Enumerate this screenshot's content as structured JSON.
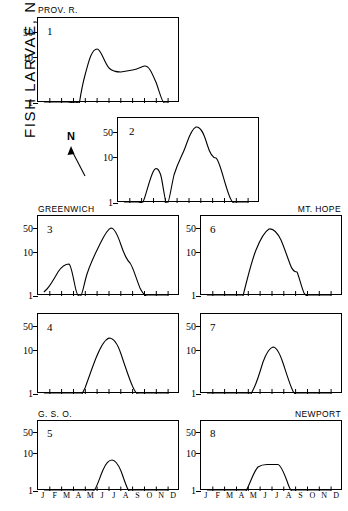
{
  "figure": {
    "y_axis_title_main": "FISH  LARVAE,  No. / m",
    "y_axis_title_exponent": "3",
    "compass_label": "N",
    "station_captions": {
      "prov_r": "PROV.  R.",
      "greenwich": "GREENWICH",
      "mt_hope": "MT.  HOPE",
      "gso": "G.  S.  O.",
      "newport": "NEWPORT"
    },
    "y_tick_labels": [
      "50",
      "10",
      "1"
    ],
    "month_labels": [
      "J",
      "F",
      "M",
      "A",
      "M",
      "J",
      "J",
      "A",
      "S",
      "O",
      "N",
      "D"
    ],
    "panel_numbers": [
      "1",
      "2",
      "3",
      "4",
      "5",
      "6",
      "7",
      "8"
    ]
  },
  "chart_data": [
    {
      "type": "line",
      "title": "PROV.  R.",
      "panel": "1",
      "xlabel": "",
      "ylabel": "FISH LARVAE, No./m3",
      "yscale": "log",
      "ylim": [
        1,
        70
      ],
      "yticks": [
        1,
        10,
        50
      ],
      "grid": false,
      "legend": "none",
      "x": [
        "J",
        "F",
        "M",
        "A",
        "M",
        "J",
        "J",
        "A",
        "S",
        "O",
        "N",
        "D"
      ],
      "values": [
        1,
        1,
        1,
        1.05,
        11,
        4.3,
        4.1,
        4.6,
        5.2,
        3.0,
        1,
        1
      ]
    },
    {
      "type": "line",
      "title": "",
      "panel": "2",
      "xlabel": "",
      "ylabel": "FISH LARVAE, No./m3",
      "yscale": "log",
      "ylim": [
        1,
        70
      ],
      "yticks": [
        1,
        10,
        50
      ],
      "grid": false,
      "legend": "none",
      "x": [
        "J",
        "F",
        "M",
        "A",
        "M",
        "J",
        "J",
        "A",
        "S",
        "O",
        "N",
        "D"
      ],
      "values": [
        1,
        1,
        1.05,
        5.0,
        1.0,
        11,
        55,
        40,
        10,
        1,
        1,
        1
      ]
    },
    {
      "type": "line",
      "title": "GREENWICH",
      "panel": "3",
      "xlabel": "",
      "ylabel": "FISH LARVAE, No./m3",
      "yscale": "log",
      "ylim": [
        1,
        70
      ],
      "yticks": [
        1,
        10,
        50
      ],
      "grid": false,
      "legend": "none",
      "x": [
        "J",
        "F",
        "M",
        "A",
        "M",
        "J",
        "J",
        "A",
        "S",
        "O",
        "N",
        "D"
      ],
      "values": [
        1.1,
        1.3,
        5.0,
        1.0,
        3.5,
        13,
        40,
        20,
        6,
        1,
        1,
        1
      ]
    },
    {
      "type": "line",
      "title": "",
      "panel": "4",
      "xlabel": "",
      "ylabel": "FISH LARVAE, No./m3",
      "yscale": "log",
      "ylim": [
        1,
        70
      ],
      "yticks": [
        1,
        10,
        50
      ],
      "grid": false,
      "legend": "none",
      "x": [
        "J",
        "F",
        "M",
        "A",
        "M",
        "J",
        "J",
        "A",
        "S",
        "O",
        "N",
        "D"
      ],
      "values": [
        1,
        1,
        1,
        1.05,
        2.6,
        9,
        25,
        14,
        4.5,
        1,
        1,
        1
      ]
    },
    {
      "type": "line",
      "title": "G.  S.  O.",
      "panel": "5",
      "xlabel": "",
      "ylabel": "FISH LARVAE, No./m3",
      "yscale": "log",
      "ylim": [
        1,
        70
      ],
      "yticks": [
        1,
        10,
        50
      ],
      "grid": false,
      "legend": "none",
      "x": [
        "J",
        "F",
        "M",
        "A",
        "M",
        "J",
        "J",
        "A",
        "S",
        "O",
        "N",
        "D"
      ],
      "values": [
        1,
        1,
        1,
        1,
        1.05,
        5.0,
        6.8,
        5.2,
        1.05,
        1,
        1,
        1
      ]
    },
    {
      "type": "line",
      "title": "MT.  HOPE",
      "panel": "6",
      "xlabel": "",
      "ylabel": "FISH LARVAE, No./m3",
      "yscale": "log",
      "ylim": [
        1,
        70
      ],
      "yticks": [
        1,
        10,
        50
      ],
      "grid": false,
      "legend": "none",
      "x": [
        "J",
        "F",
        "M",
        "A",
        "M",
        "J",
        "J",
        "A",
        "S",
        "O",
        "N",
        "D"
      ],
      "values": [
        1,
        1,
        1,
        1.05,
        6,
        20,
        40,
        22,
        4,
        1,
        1,
        1
      ]
    },
    {
      "type": "line",
      "title": "",
      "panel": "7",
      "xlabel": "",
      "ylabel": "FISH LARVAE, No./m3",
      "yscale": "log",
      "ylim": [
        1,
        70
      ],
      "yticks": [
        1,
        10,
        50
      ],
      "grid": false,
      "legend": "none",
      "x": [
        "J",
        "F",
        "M",
        "A",
        "M",
        "J",
        "J",
        "A",
        "S",
        "O",
        "N",
        "D"
      ],
      "values": [
        1,
        1,
        1,
        1,
        1.6,
        6.5,
        13,
        8,
        1.3,
        1,
        1,
        1
      ]
    },
    {
      "type": "line",
      "title": "NEWPORT",
      "panel": "8",
      "xlabel": "",
      "ylabel": "FISH LARVAE, No./m3",
      "yscale": "log",
      "ylim": [
        1,
        70
      ],
      "yticks": [
        1,
        10,
        50
      ],
      "grid": false,
      "legend": "none",
      "x": [
        "J",
        "F",
        "M",
        "A",
        "M",
        "J",
        "J",
        "A",
        "S",
        "O",
        "N",
        "D"
      ],
      "values": [
        1,
        1,
        1,
        1.05,
        3.2,
        4.2,
        4.2,
        2.6,
        1,
        1,
        1,
        1
      ]
    }
  ]
}
